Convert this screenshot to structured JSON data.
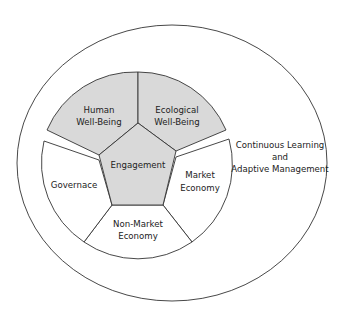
{
  "diagram": {
    "outer_label": {
      "line1": "Continuous Learning",
      "line2": "and",
      "line3": "Adaptive Management"
    },
    "center": {
      "label": "Engagement"
    },
    "segments": [
      {
        "line1": "Human",
        "line2": "Well-Being",
        "shaded": true
      },
      {
        "line1": "Ecological",
        "line2": "Well-Being",
        "shaded": true
      },
      {
        "line1": "Market",
        "line2": "Economy",
        "shaded": false
      },
      {
        "line1": "Non-Market",
        "line2": "Economy",
        "shaded": false
      },
      {
        "line1": "Governace",
        "line2": "",
        "shaded": false
      }
    ],
    "colors": {
      "shaded": "#d9d9d9",
      "stroke": "#333333",
      "background": "#ffffff"
    }
  }
}
